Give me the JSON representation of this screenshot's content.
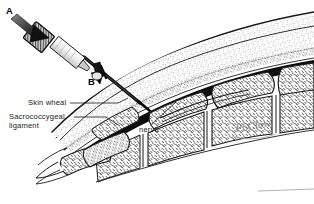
{
  "figure": {
    "background_color": "#ffffff",
    "ink_color": "#1b1b1b",
    "signature": "PSClow"
  },
  "markers": [
    {
      "id": "a",
      "label": "A",
      "meaning": "initial steep needle angle approach"
    },
    {
      "id": "b",
      "label": "B",
      "meaning": "needle angle after entering the canal"
    }
  ],
  "labels": [
    {
      "id": "skin-wheal",
      "text": "Skin wheal",
      "leader": true
    },
    {
      "id": "sacrococcygeal-ligament",
      "line1": "Sacrococcygeal",
      "line2": "ligament",
      "leader": true
    },
    {
      "id": "nerve",
      "text": "nerve",
      "leader": true
    }
  ],
  "anatomy": {
    "structures": [
      "sacrum",
      "sacral vertebral bodies",
      "sacral canal",
      "sacrococcygeal ligament",
      "coccyx",
      "nerve",
      "skin",
      "subcutaneous tissue"
    ]
  },
  "instrument": {
    "name": "syringe with needle",
    "parts": [
      "knurled hub",
      "barrel",
      "needle"
    ]
  },
  "footer_rule": {
    "visible": true,
    "color": "#b4b4b4"
  }
}
